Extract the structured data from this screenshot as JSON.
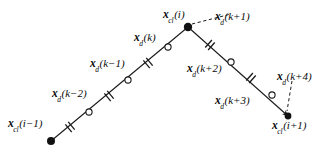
{
  "figure": {
    "kind": "path-discretization-diagram",
    "background_color": "#ffffff",
    "stroke_color": "#1a1a1a",
    "text_color": "#0a0a0a",
    "width": 333,
    "height": 153,
    "labels": [
      {
        "id": "x-cl-i-minus-1",
        "symbol": "x",
        "subscript": "cl",
        "argument": "(i−1)",
        "text": "x_cl(i−1)",
        "x": 8,
        "y": 118,
        "marker": "filled-dot"
      },
      {
        "id": "x-d-k-minus-2",
        "symbol": "x",
        "subscript": "d",
        "argument": "(k−2)",
        "text": "x_d(k−2)",
        "x": 52,
        "y": 88,
        "marker": "open-circle"
      },
      {
        "id": "x-d-k-minus-1",
        "symbol": "x",
        "subscript": "d",
        "argument": "(k−1)",
        "text": "x_d(k−1)",
        "x": 90,
        "y": 58,
        "marker": "open-circle"
      },
      {
        "id": "x-d-k",
        "symbol": "x",
        "subscript": "d",
        "argument": "(k)",
        "text": "x_d(k)",
        "x": 134,
        "y": 32,
        "marker": "open-circle"
      },
      {
        "id": "x-cl-i",
        "symbol": "x",
        "subscript": "cl",
        "argument": "(i)",
        "text": "x_cl(i)",
        "x": 163,
        "y": 9,
        "marker": "filled-dot"
      },
      {
        "id": "x-d-k-plus-1",
        "symbol": "x",
        "subscript": "d",
        "argument": "(k+1)",
        "text": "x_d(k+1)",
        "x": 215,
        "y": 11,
        "marker": "leader-dashed"
      },
      {
        "id": "x-d-k-plus-2",
        "symbol": "x",
        "subscript": "d",
        "argument": "(k+2)",
        "text": "x_d(k+2)",
        "x": 187,
        "y": 63,
        "marker": "open-circle"
      },
      {
        "id": "x-d-k-plus-3",
        "symbol": "x",
        "subscript": "d",
        "argument": "(k+3)",
        "text": "x_d(k+3)",
        "x": 215,
        "y": 95,
        "marker": "open-circle"
      },
      {
        "id": "x-d-k-plus-4",
        "symbol": "x",
        "subscript": "d",
        "argument": "(k+4)",
        "text": "x_d(k+4)",
        "x": 277,
        "y": 71,
        "marker": "leader-dashed"
      },
      {
        "id": "x-cl-i-plus-1",
        "symbol": "x",
        "subscript": "cl",
        "argument": "(i+1)",
        "text": "x_cl(i+1)",
        "x": 272,
        "y": 120,
        "marker": "filled-dot"
      }
    ],
    "points": {
      "filled_dots": [
        {
          "id": "dot-x-cl-i-minus-1",
          "x": 51,
          "y": 141
        },
        {
          "id": "dot-x-cl-i",
          "x": 188,
          "y": 27
        },
        {
          "id": "dot-x-cl-i-plus-1",
          "x": 288,
          "y": 116
        }
      ],
      "open_circles": [
        {
          "id": "circle-x-d-k-minus-2",
          "x": 89,
          "y": 112
        },
        {
          "id": "circle-x-d-k-minus-1",
          "x": 128,
          "y": 80
        },
        {
          "id": "circle-x-d-k",
          "x": 168,
          "y": 47
        },
        {
          "id": "circle-x-d-k-plus-2",
          "x": 231,
          "y": 62
        },
        {
          "id": "circle-x-d-k-plus-3",
          "x": 272,
          "y": 95
        }
      ],
      "hash_ticks": [
        {
          "id": "tick-1",
          "x": 70,
          "y": 127
        },
        {
          "id": "tick-2",
          "x": 109,
          "y": 96
        },
        {
          "id": "tick-3",
          "x": 148,
          "y": 63
        },
        {
          "id": "tick-4",
          "x": 210,
          "y": 45
        },
        {
          "id": "tick-5",
          "x": 251,
          "y": 78
        }
      ]
    },
    "segments": [
      {
        "id": "left-branch",
        "style": "solid",
        "x1": 51,
        "y1": 141,
        "x2": 188,
        "y2": 27
      },
      {
        "id": "right-branch",
        "style": "solid",
        "x1": 188,
        "y1": 27,
        "x2": 288,
        "y2": 116
      }
    ],
    "leaders": [
      {
        "id": "leader-x-d-k-plus-1",
        "style": "dashed",
        "x1": 191,
        "y1": 24,
        "x2": 232,
        "y2": 14
      },
      {
        "id": "leader-x-d-k-plus-4",
        "style": "dashed",
        "x1": 291,
        "y1": 80,
        "x2": 287,
        "y2": 110
      }
    ]
  }
}
